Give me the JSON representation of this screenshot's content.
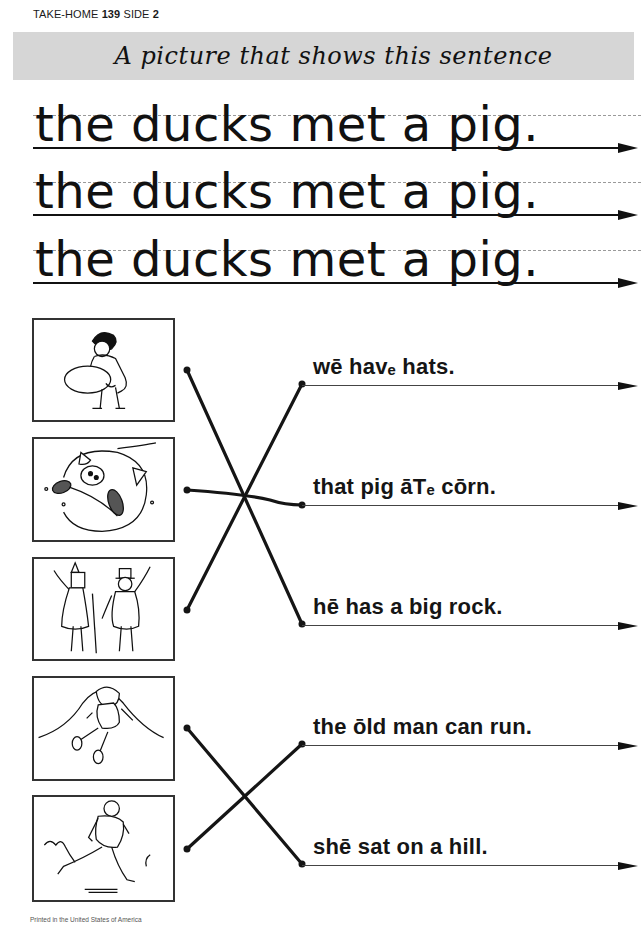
{
  "header": {
    "label": "TAKE-HOME",
    "number": "139",
    "side_label": "SIDE",
    "side_number": "2"
  },
  "banner": {
    "title": "A picture that shows this sentence"
  },
  "copy_sentence": {
    "text": "the ducks met a pig.",
    "rows": [
      {
        "text": "the ducks met a pig."
      },
      {
        "text": "the ducks met a pig."
      },
      {
        "text": "the ducks met a pig."
      }
    ]
  },
  "pictures": [
    {
      "id": 1,
      "description": "boy lifting a big rock"
    },
    {
      "id": 2,
      "description": "pig eating corn"
    },
    {
      "id": 3,
      "description": "two girls wearing hats"
    },
    {
      "id": 4,
      "description": "girl sitting on a hill"
    },
    {
      "id": 5,
      "description": "old man running"
    }
  ],
  "answers": [
    {
      "text": "wē havₑ hats."
    },
    {
      "text": "that pig āTₑ cōrn."
    },
    {
      "text": "hē has a big rock."
    },
    {
      "text": "the ōld man can run."
    },
    {
      "text": "shē sat on a hill."
    }
  ],
  "matches": [
    {
      "picture": 1,
      "answer": 3
    },
    {
      "picture": 2,
      "answer": 2
    },
    {
      "picture": 3,
      "answer": 1
    },
    {
      "picture": 4,
      "answer": 5
    },
    {
      "picture": 5,
      "answer": 4
    }
  ],
  "footer": {
    "text": "Printed in the United States of America"
  },
  "colors": {
    "ink": "#111111",
    "banner_bg": "#d6d6d6",
    "dashed_line": "#9a9a9a"
  }
}
